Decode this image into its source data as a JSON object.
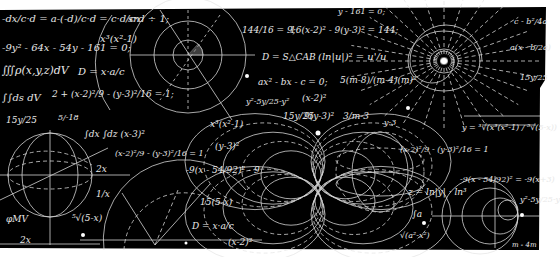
{
  "image": {
    "description": "Chalkboard-style illustration of handwritten math formulas and geometric line drawings on a black background",
    "background_color": "#000000",
    "chalk_color": "#e8e8e8",
    "margin_color": "#ffffff"
  },
  "formulas": [
    {
      "id": "f1",
      "text": "-dx/c·d = a-(-d)/c·d = c·d/c·d ÷ 1;",
      "x": 2,
      "y": 14,
      "size": 10
    },
    {
      "id": "f2",
      "text": "sn",
      "x": 128,
      "y": 14,
      "size": 10
    },
    {
      "id": "f3",
      "text": "-9y² - 64x - 54y - 161 = 0;",
      "x": 2,
      "y": 43,
      "size": 10
    },
    {
      "id": "f4",
      "text": "x³(x²-1)",
      "x": 100,
      "y": 34,
      "size": 10
    },
    {
      "id": "f5",
      "text": "∭ρ(x,y,z)dV",
      "x": 2,
      "y": 65,
      "size": 11
    },
    {
      "id": "f6",
      "text": "D = x·a/c",
      "x": 78,
      "y": 67,
      "size": 10
    },
    {
      "id": "f7",
      "text": "∫∫ds dV",
      "x": 2,
      "y": 93,
      "size": 10
    },
    {
      "id": "f8",
      "text": "2 + (x-2)²/9 - (y-3)²/16 = 1;",
      "x": 52,
      "y": 90,
      "size": 9
    },
    {
      "id": "f9",
      "text": "15y/25",
      "x": 6,
      "y": 116,
      "size": 9
    },
    {
      "id": "f10",
      "text": "5/-18",
      "x": 58,
      "y": 114,
      "size": 8
    },
    {
      "id": "f11",
      "text": "∫dx ∫dz (x-3)²",
      "x": 84,
      "y": 130,
      "size": 9
    },
    {
      "id": "f12",
      "text": "(x-2)²/9 - (y-3)²/16 = 1",
      "x": 115,
      "y": 150,
      "size": 8
    },
    {
      "id": "f13",
      "text": "2x",
      "x": 96,
      "y": 165,
      "size": 9
    },
    {
      "id": "f14",
      "text": "1/x",
      "x": 96,
      "y": 190,
      "size": 9
    },
    {
      "id": "f15",
      "text": "φMV",
      "x": 6,
      "y": 215,
      "size": 9
    },
    {
      "id": "f16",
      "text": "⁵√(5-x)",
      "x": 72,
      "y": 214,
      "size": 9
    },
    {
      "id": "f17",
      "text": "2x",
      "x": 20,
      "y": 236,
      "size": 9
    },
    {
      "id": "f18",
      "text": "144/16 = 9;",
      "x": 242,
      "y": 26,
      "size": 9
    },
    {
      "id": "f19",
      "text": "16(x-2)² - 9(y-3)² = 144;",
      "x": 290,
      "y": 26,
      "size": 9
    },
    {
      "id": "f20",
      "text": "y - 161 = 0;",
      "x": 338,
      "y": 8,
      "size": 8
    },
    {
      "id": "f21",
      "text": "D = S△CAB",
      "x": 262,
      "y": 53,
      "size": 9
    },
    {
      "id": "f22",
      "text": "(ln|u|)² = u'/u",
      "x": 318,
      "y": 52,
      "size": 10
    },
    {
      "id": "f23",
      "text": "ax² - bx - c = 0;",
      "x": 258,
      "y": 78,
      "size": 9
    },
    {
      "id": "f24",
      "text": "5(m-8)/(m-4)(m)²",
      "x": 340,
      "y": 76,
      "size": 9
    },
    {
      "id": "f25",
      "text": "(x-2)²",
      "x": 302,
      "y": 94,
      "size": 9
    },
    {
      "id": "f26",
      "text": "y²-5y/25-y²",
      "x": 246,
      "y": 98,
      "size": 8
    },
    {
      "id": "f27",
      "text": "15y/25",
      "x": 283,
      "y": 112,
      "size": 9
    },
    {
      "id": "f28",
      "text": "9(y-3)²",
      "x": 304,
      "y": 112,
      "size": 9
    },
    {
      "id": "f29",
      "text": "3/m-3",
      "x": 343,
      "y": 112,
      "size": 9
    },
    {
      "id": "f30",
      "text": "x³(x²-1)",
      "x": 210,
      "y": 120,
      "size": 9
    },
    {
      "id": "f31",
      "text": "(y-3)²",
      "x": 215,
      "y": 142,
      "size": 9
    },
    {
      "id": "f32",
      "text": "-9(x - 54/92)² - 9",
      "x": 186,
      "y": 166,
      "size": 9
    },
    {
      "id": "f33",
      "text": "15(5-x)",
      "x": 200,
      "y": 198,
      "size": 9
    },
    {
      "id": "f34",
      "text": "D = x·a/c",
      "x": 192,
      "y": 222,
      "size": 9
    },
    {
      "id": "f35",
      "text": "(x-2)²",
      "x": 228,
      "y": 238,
      "size": 9
    },
    {
      "id": "f36",
      "text": "c - b²/4a",
      "x": 514,
      "y": 18,
      "size": 8
    },
    {
      "id": "f37",
      "text": "a(x - b/2a)",
      "x": 510,
      "y": 44,
      "size": 8
    },
    {
      "id": "f38",
      "text": "15y/25",
      "x": 520,
      "y": 74,
      "size": 8
    },
    {
      "id": "f39",
      "text": "y-3",
      "x": 384,
      "y": 119,
      "size": 8
    },
    {
      "id": "f40",
      "text": "y = ³√(x³(x²-1) / ⁵√(5-x))",
      "x": 462,
      "y": 124,
      "size": 8
    },
    {
      "id": "f41",
      "text": "(x-2)²/9 - (y-3)²/16 = 1",
      "x": 400,
      "y": 146,
      "size": 8
    },
    {
      "id": "f42",
      "text": "-9(x - 54/92)² = -9(x+3)",
      "x": 460,
      "y": 176,
      "size": 8
    },
    {
      "id": "f43",
      "text": "z = ln|y| · ln³",
      "x": 408,
      "y": 188,
      "size": 9
    },
    {
      "id": "f44",
      "text": "∫a",
      "x": 412,
      "y": 210,
      "size": 9
    },
    {
      "id": "f45",
      "text": "y²-5y/25-y",
      "x": 520,
      "y": 196,
      "size": 8
    },
    {
      "id": "f46",
      "text": "√(a²-x²)",
      "x": 400,
      "y": 232,
      "size": 8
    },
    {
      "id": "f47",
      "text": "m - 4m",
      "x": 512,
      "y": 242,
      "size": 7
    }
  ],
  "drawings": [
    {
      "name": "concentric-circles-diagram",
      "cx": 188,
      "cy": 55,
      "radii": [
        15,
        34,
        58
      ]
    },
    {
      "name": "radial-star-diagram",
      "cx": 444,
      "cy": 61,
      "rays": 28
    },
    {
      "name": "globe-sphere-diagram",
      "cx": 50,
      "cy": 175,
      "r": 42
    },
    {
      "name": "semicircle-protractor-diagram",
      "cx": 155,
      "cy": 250,
      "r": 80
    },
    {
      "name": "butterfly-curves-diagram",
      "cx": 318,
      "cy": 188
    },
    {
      "name": "nested-tangent-circles-diagram",
      "cx": 496,
      "cy": 216
    }
  ]
}
